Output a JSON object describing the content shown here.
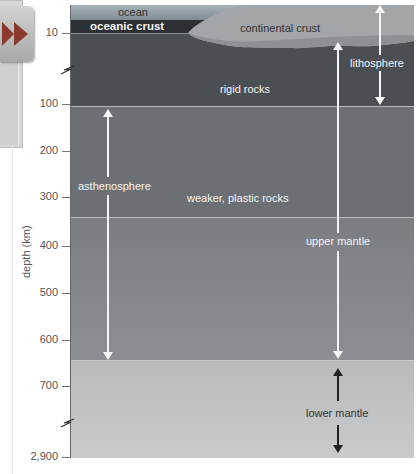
{
  "diagram": {
    "type": "cross-section",
    "axis": {
      "label": "depth (km)",
      "ticks": [
        {
          "label": "10",
          "y": 33
        },
        {
          "label": "100",
          "y": 104
        },
        {
          "label": "200",
          "y": 151
        },
        {
          "label": "300",
          "y": 197
        },
        {
          "label": "400",
          "y": 246
        },
        {
          "label": "500",
          "y": 293
        },
        {
          "label": "600",
          "y": 340
        },
        {
          "label": "700",
          "y": 386
        },
        {
          "label": "2,900",
          "y": 457
        }
      ],
      "breaks": [
        "between 10 and 100",
        "between 700 and 2,900"
      ]
    },
    "layers": {
      "ocean": "ocean",
      "oceanic_crust": "oceanic crust",
      "continental_crust": "continental crust",
      "rigid": "rigid rocks",
      "plastic": "weaker, plastic rocks"
    },
    "spans": {
      "lithosphere": "lithosphere",
      "asthenosphere": "asthenosphere",
      "upper_mantle": "upper mantle",
      "lower_mantle": "lower mantle"
    },
    "colors": {
      "ocean": "#98a3aa",
      "oceanic_crust": "#2d3135",
      "continental_crust": "#9fa2a5",
      "lithosphere": "#4b4e52",
      "asthenosphere": "#6c6f73",
      "upper_mantle_lower": "#85888c",
      "lower_mantle": "#c2c4c6"
    }
  },
  "nav": {
    "next_icon": "double-chevron-right"
  }
}
